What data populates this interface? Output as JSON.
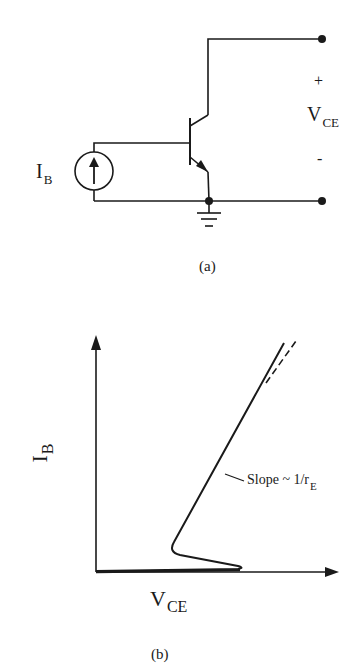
{
  "figure_a": {
    "caption": "(a)",
    "source_label": {
      "main": "I",
      "sub": "B"
    },
    "output_label": {
      "main": "V",
      "sub": "CE"
    },
    "plus_sign": "+",
    "minus_sign": "-"
  },
  "figure_b": {
    "caption": "(b)",
    "y_axis_label": {
      "main": "I",
      "sub": "B"
    },
    "x_axis_label": {
      "main": "V",
      "sub": "CE"
    },
    "annotation": {
      "main": "Slope ~ 1/r",
      "sub": "E"
    }
  },
  "colors": {
    "ink": "#1a1a1a",
    "background": "#ffffff"
  }
}
